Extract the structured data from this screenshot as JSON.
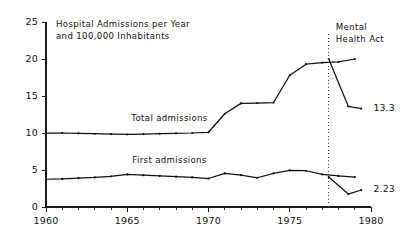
{
  "chart_data": {
    "type": "line",
    "title_line1": "Hospital Admissions per Year",
    "title_line2": "and 100,000 Inhabitants",
    "xlabel": "",
    "ylabel": "",
    "xlim": [
      1960,
      1980
    ],
    "ylim": [
      0,
      25
    ],
    "y_ticks": [
      0,
      5,
      10,
      15,
      20,
      25
    ],
    "y_tick_labels": [
      "0",
      "5",
      "10",
      "15",
      "20",
      "25"
    ],
    "x_ticks": [
      1960,
      1965,
      1970,
      1975,
      1980
    ],
    "x_tick_labels": [
      "1960",
      "1965",
      "1970",
      "1975",
      "1980"
    ],
    "x_minor_tick_step": 1,
    "grid": false,
    "legend_position": "inline-labels",
    "series": [
      {
        "name": "Total admissions",
        "label": "Total admissions",
        "label_x": 1967.6,
        "label_y": 11.6,
        "end_value_label": "13.3",
        "x": [
          1960,
          1961,
          1962,
          1963,
          1964,
          1965,
          1966,
          1967,
          1968,
          1969,
          1970,
          1971,
          1972,
          1973,
          1974,
          1975,
          1976,
          1977,
          1978,
          1979
        ],
        "values": [
          10.0,
          10.0,
          9.95,
          9.9,
          9.85,
          9.8,
          9.85,
          9.9,
          9.95,
          10.0,
          10.1,
          12.6,
          14.0,
          14.05,
          14.1,
          17.8,
          19.3,
          19.5,
          19.6,
          20.0
        ]
      },
      {
        "name": "First admissions",
        "label": "First admissions",
        "label_x": 1967.6,
        "label_y": 6.0,
        "end_value_label": "2.23",
        "x": [
          1960,
          1961,
          1962,
          1963,
          1964,
          1965,
          1966,
          1967,
          1968,
          1969,
          1970,
          1971,
          1972,
          1973,
          1974,
          1975,
          1976,
          1977,
          1978,
          1979
        ],
        "values": [
          3.75,
          3.8,
          3.9,
          4.0,
          4.15,
          4.4,
          4.3,
          4.2,
          4.1,
          4.0,
          3.85,
          4.55,
          4.3,
          3.95,
          4.55,
          4.95,
          4.9,
          4.4,
          4.2,
          4.05
        ]
      }
    ],
    "post_event_segments": [
      {
        "series": "Total admissions",
        "x": [
          1977.4,
          1978.6,
          1979.4
        ],
        "values": [
          20.0,
          13.6,
          13.3
        ]
      },
      {
        "series": "First admissions",
        "x": [
          1977.4,
          1978.6,
          1979.4
        ],
        "values": [
          4.05,
          1.75,
          2.3
        ]
      }
    ],
    "annotations": [
      {
        "name": "mental-health-act",
        "label_line1": "Mental",
        "label_line2": "Health Act",
        "x": 1977.4,
        "style": "vertical-dotted-line"
      }
    ],
    "end_labels": [
      {
        "text": "13.3",
        "x": 1979.9,
        "y": 13.3
      },
      {
        "text": "2.23",
        "x": 1979.9,
        "y": 2.3
      }
    ],
    "colors": {
      "line": "#111111",
      "axis": "#1a1a1a",
      "event_line": "#444444",
      "background": "#ffffff"
    }
  }
}
